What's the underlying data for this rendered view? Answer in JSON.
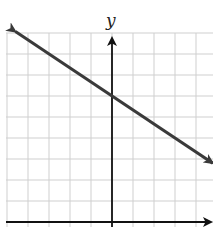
{
  "chart_data": {
    "type": "line",
    "title": "",
    "xlabel": "",
    "ylabel": "y",
    "grid": true,
    "grid_spacing_units": 1,
    "axis_ranges": {
      "x": [
        -5,
        5
      ],
      "y": [
        0,
        9
      ]
    },
    "series": [
      {
        "name": "line",
        "equation": "y = -(2/3)x + 6",
        "slope": -0.6667,
        "y_intercept": 6,
        "x": [
          -4.6,
          0,
          4.8
        ],
        "y": [
          9.07,
          6,
          2.8
        ],
        "arrows": "both"
      }
    ],
    "colors": {
      "line": "#3a3a3a",
      "axes": "#111111",
      "grid": "#cfcfcf"
    }
  },
  "labels": {
    "y_axis": "y"
  }
}
